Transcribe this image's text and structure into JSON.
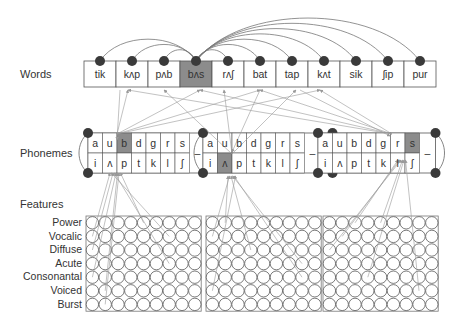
{
  "labels": {
    "words": "Words",
    "phonemes": "Phonemes",
    "features": "Features"
  },
  "words": [
    "tik",
    "kʌp",
    "pʌb",
    "bʌs",
    "rʌʃ",
    "bat",
    "tap",
    "kʌt",
    "sik",
    "ʃip",
    "pur"
  ],
  "active_word_index": 3,
  "phoneme_groups": [
    {
      "top": [
        "a",
        "u",
        "b",
        "d",
        "g",
        "r",
        "s"
      ],
      "bottom": [
        "i",
        "ʌ",
        "p",
        "t",
        "k",
        "l",
        "ʃ"
      ],
      "separator": "–",
      "active": {
        "row": "top",
        "index": 2
      }
    },
    {
      "top": [
        "a",
        "u",
        "b",
        "d",
        "g",
        "r",
        "s"
      ],
      "bottom": [
        "i",
        "ʌ",
        "p",
        "t",
        "k",
        "l",
        "ʃ"
      ],
      "separator": "–",
      "active": {
        "row": "bottom",
        "index": 1
      }
    },
    {
      "top": [
        "a",
        "u",
        "b",
        "d",
        "g",
        "r",
        "s"
      ],
      "bottom": [
        "i",
        "ʌ",
        "p",
        "t",
        "k",
        "l",
        "ʃ"
      ],
      "separator": "–",
      "active": {
        "row": "top",
        "index": 6
      }
    }
  ],
  "features": [
    "Power",
    "Vocalic",
    "Diffuse",
    "Acute",
    "Consonantal",
    "Voiced",
    "Burst"
  ],
  "feature_grid": {
    "panels": 3,
    "columns_per_panel": 9,
    "rows": 7
  },
  "colors": {
    "active_cell": "#8c8c8c",
    "node": "#3a3a3a",
    "line": "#999999",
    "border": "#555555"
  }
}
